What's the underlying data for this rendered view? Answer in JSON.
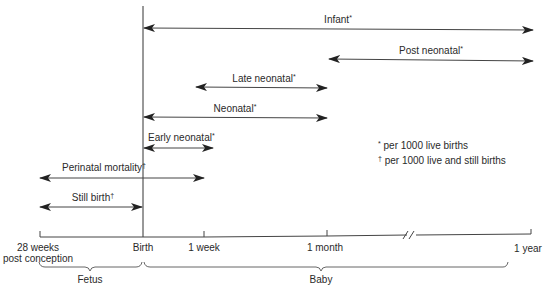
{
  "diagram": {
    "title": "",
    "periods": [
      {
        "id": "infant",
        "label": "Infant",
        "mark": "*",
        "from": "Birth",
        "to": "1 year"
      },
      {
        "id": "post-neonatal",
        "label": "Post neonatal",
        "mark": "*",
        "from": "1 month",
        "to": "1 year"
      },
      {
        "id": "late-neonatal",
        "label": "Late neonatal",
        "mark": "*",
        "from": "1 week",
        "to": "1 month"
      },
      {
        "id": "neonatal",
        "label": "Neonatal",
        "mark": "*",
        "from": "Birth",
        "to": "1 month"
      },
      {
        "id": "early-neonatal",
        "label": "Early neonatal",
        "mark": "*",
        "from": "Birth",
        "to": "1 week"
      },
      {
        "id": "perinatal-mortality",
        "label": "Perinatal mortality",
        "mark": "†",
        "from": "28 weeks post conception",
        "to": "1 week"
      },
      {
        "id": "still-birth",
        "label": "Still birth",
        "mark": "†",
        "from": "28 weeks post conception",
        "to": "Birth"
      }
    ],
    "axis": {
      "ticks": [
        {
          "label_line1": "28 weeks",
          "label_line2": "post conception"
        },
        {
          "label_line1": "Birth"
        },
        {
          "label_line1": "1 week"
        },
        {
          "label_line1": "1 month"
        },
        {
          "label_line1": "1 year"
        }
      ],
      "break_marker": "//"
    },
    "braces": [
      {
        "label": "Fetus",
        "from": "28 weeks post conception",
        "to": "Birth"
      },
      {
        "label": "Baby",
        "from": "Birth",
        "to": "1 year"
      }
    ],
    "legend": [
      {
        "mark": "*",
        "text": "per 1000 live births"
      },
      {
        "mark": "†",
        "text": "per 1000 live and still births"
      }
    ],
    "colors": {
      "line": "#333333",
      "text": "#2a2a2a",
      "background": "#ffffff"
    }
  }
}
